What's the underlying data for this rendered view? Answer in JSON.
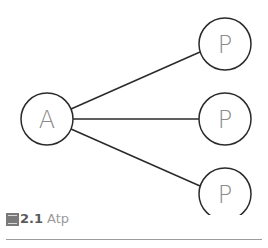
{
  "diagram": {
    "stroke_color": "#2a2a2a",
    "label_color": "#8a8a8a",
    "nodes": [
      {
        "id": "A",
        "label": "A",
        "cx": 47,
        "cy": 119,
        "r": 26
      },
      {
        "id": "P1",
        "label": "P",
        "cx": 225,
        "cy": 44,
        "r": 26
      },
      {
        "id": "P2",
        "label": "P",
        "cx": 225,
        "cy": 119,
        "r": 26
      },
      {
        "id": "P3",
        "label": "P",
        "cx": 225,
        "cy": 194,
        "r": 26
      }
    ],
    "edges": [
      {
        "from": "A",
        "to": "P1"
      },
      {
        "from": "A",
        "to": "P2"
      },
      {
        "from": "A",
        "to": "P3"
      }
    ]
  },
  "caption": {
    "figure_number": "2.1",
    "text": "Atp"
  }
}
